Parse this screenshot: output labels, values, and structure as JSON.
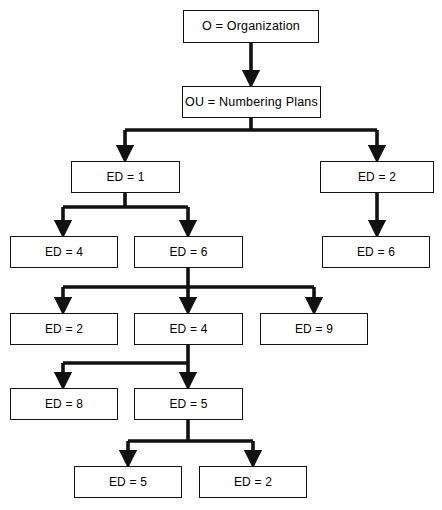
{
  "diagram": {
    "type": "tree-diagram",
    "background_color": "#ffffff",
    "line_color": "#111111",
    "box_border_color": "#111111",
    "box_fill_color": "#ffffff",
    "text_color": "#000000",
    "levels": [
      {
        "level": 0,
        "label": "Organization"
      },
      {
        "level": 1,
        "label": "Organizational Unit"
      },
      {
        "level": 2,
        "label": "Entity Directory Level 1"
      },
      {
        "level": 3,
        "label": "Entity Directory Level 2"
      },
      {
        "level": 4,
        "label": "Entity Directory Level 3"
      },
      {
        "level": 5,
        "label": "Entity Directory Level 4"
      },
      {
        "level": 6,
        "label": "Entity Directory Level 5"
      }
    ],
    "nodes": [
      {
        "id": "o",
        "label": "O = Organization",
        "x": 183,
        "y": 10,
        "w": 136,
        "h": 33,
        "kind": "root-node"
      },
      {
        "id": "ou",
        "label": "OU = Numbering Plans",
        "x": 182,
        "y": 86,
        "w": 139,
        "h": 32,
        "kind": "unit-node"
      },
      {
        "id": "ed1",
        "label": "ED = 1",
        "x": 71,
        "y": 161,
        "w": 109,
        "h": 32,
        "kind": "ed-node"
      },
      {
        "id": "ed2a",
        "label": "ED = 2",
        "x": 320,
        "y": 161,
        "w": 114,
        "h": 32,
        "kind": "ed-node"
      },
      {
        "id": "ed4a",
        "label": "ED = 4",
        "x": 10,
        "y": 236,
        "w": 108,
        "h": 32,
        "kind": "ed-node"
      },
      {
        "id": "ed6a",
        "label": "ED = 6",
        "x": 134,
        "y": 236,
        "w": 109,
        "h": 32,
        "kind": "ed-node"
      },
      {
        "id": "ed6b",
        "label": "ED = 6",
        "x": 322,
        "y": 236,
        "w": 108,
        "h": 32,
        "kind": "ed-node"
      },
      {
        "id": "ed2b",
        "label": "ED = 2",
        "x": 10,
        "y": 313,
        "w": 108,
        "h": 32,
        "kind": "ed-node"
      },
      {
        "id": "ed4b",
        "label": "ED = 4",
        "x": 134,
        "y": 313,
        "w": 109,
        "h": 32,
        "kind": "ed-node"
      },
      {
        "id": "ed9",
        "label": "ED = 9",
        "x": 260,
        "y": 313,
        "w": 108,
        "h": 32,
        "kind": "ed-node"
      },
      {
        "id": "ed8",
        "label": "ED = 8",
        "x": 10,
        "y": 388,
        "w": 108,
        "h": 32,
        "kind": "ed-node"
      },
      {
        "id": "ed5a",
        "label": "ED = 5",
        "x": 134,
        "y": 388,
        "w": 109,
        "h": 32,
        "kind": "ed-node"
      },
      {
        "id": "ed5b",
        "label": "ED = 5",
        "x": 74,
        "y": 466,
        "w": 108,
        "h": 32,
        "kind": "ed-node"
      },
      {
        "id": "ed2c",
        "label": "ED = 2",
        "x": 199,
        "y": 466,
        "w": 108,
        "h": 32,
        "kind": "ed-node"
      }
    ],
    "edges": [
      {
        "from": "o",
        "to": [
          "ou"
        ],
        "style": "straight"
      },
      {
        "from": "ou",
        "to": [
          "ed1",
          "ed2a"
        ],
        "style": "bus"
      },
      {
        "from": "ed1",
        "to": [
          "ed4a",
          "ed6a"
        ],
        "style": "bus"
      },
      {
        "from": "ed2a",
        "to": [
          "ed6b"
        ],
        "style": "straight"
      },
      {
        "from": "ed6a",
        "to": [
          "ed2b",
          "ed4b",
          "ed9"
        ],
        "style": "bus"
      },
      {
        "from": "ed4b",
        "to": [
          "ed8",
          "ed5a"
        ],
        "style": "bus"
      },
      {
        "from": "ed5a",
        "to": [
          "ed5b",
          "ed2c"
        ],
        "style": "bus"
      }
    ]
  },
  "chart_data": {
    "type": "table",
    "categories": [
      "O = Organization",
      "OU = Numbering Plans",
      "ED = 1",
      "ED = 2",
      "ED = 4",
      "ED = 6",
      "ED = 6",
      "ED = 2",
      "ED = 4",
      "ED = 9",
      "ED = 8",
      "ED = 5",
      "ED = 5",
      "ED = 2"
    ],
    "values": [
      0,
      1,
      2,
      2,
      3,
      3,
      3,
      4,
      4,
      4,
      5,
      5,
      6,
      6
    ],
    "xlabel": "Node",
    "ylabel": "Depth level"
  }
}
